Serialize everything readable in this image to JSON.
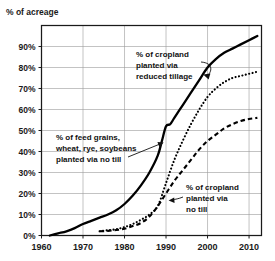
{
  "chart_data": {
    "type": "line",
    "title": "% of acreage",
    "xlabel": "",
    "ylabel": "% of acreage",
    "xlim": [
      1960,
      2013
    ],
    "ylim": [
      0,
      100
    ],
    "grid": true,
    "legend_position": "inline-annotations",
    "x_ticks": [
      "1960",
      "1970",
      "1980",
      "1990",
      "2000",
      "2010"
    ],
    "x_tick_values": [
      1960,
      1970,
      1980,
      1990,
      2000,
      2010
    ],
    "y_ticks": [
      "0%",
      "10%",
      "20%",
      "30%",
      "40%",
      "50%",
      "60%",
      "70%",
      "80%",
      "90%"
    ],
    "y_tick_values": [
      0,
      10,
      20,
      30,
      40,
      50,
      60,
      70,
      80,
      90
    ],
    "series": [
      {
        "name": "% of cropland planted via reduced tillage",
        "style": "solid",
        "x": [
          1962,
          1964,
          1966,
          1968,
          1970,
          1972,
          1974,
          1976,
          1978,
          1980,
          1982,
          1984,
          1986,
          1988,
          1989,
          1990,
          1991,
          1992,
          1994,
          1996,
          1998,
          2000,
          2002,
          2004,
          2006,
          2008,
          2010,
          2012
        ],
        "values": [
          0,
          1,
          2,
          3.5,
          5.5,
          7,
          8.5,
          10,
          12,
          15,
          19,
          24,
          30,
          38,
          45,
          52,
          53,
          56,
          62,
          68,
          74,
          80,
          84,
          87,
          89,
          91,
          93,
          95
        ]
      },
      {
        "name": "% of feed grains, wheat, rye, soybeans planted via no till",
        "style": "dotted",
        "x": [
          1974,
          1976,
          1978,
          1980,
          1982,
          1984,
          1986,
          1988,
          1990,
          1992,
          1994,
          1996,
          1998,
          2000,
          2002,
          2004,
          2006,
          2008,
          2010,
          2012
        ],
        "values": [
          2,
          2.5,
          3,
          4,
          5.5,
          7.5,
          10,
          14,
          25,
          36,
          45,
          53,
          60,
          66,
          70,
          73,
          75,
          76,
          77,
          78
        ]
      },
      {
        "name": "% of cropland planted via no till",
        "style": "dashed",
        "x": [
          1974,
          1976,
          1978,
          1980,
          1982,
          1984,
          1986,
          1988,
          1990,
          1992,
          1994,
          1996,
          1998,
          2000,
          2002,
          2004,
          2006,
          2008,
          2010,
          2012
        ],
        "values": [
          2,
          2.2,
          2.6,
          3.2,
          4.5,
          6,
          9,
          14,
          20,
          26,
          31,
          36,
          41,
          45,
          48,
          51,
          53,
          54.5,
          55.5,
          56
        ]
      }
    ],
    "annotations": [
      {
        "id": "reduced-tillage",
        "lines": [
          "% of cropland",
          "planted via",
          "reduced tillage"
        ],
        "target_series": "% of cropland planted via reduced tillage"
      },
      {
        "id": "feed-grains-no-till",
        "lines": [
          "% of feed grains,",
          "wheat, rye, soybeans",
          "planted via no till"
        ],
        "target_series": "% of feed grains, wheat, rye, soybeans planted via no till"
      },
      {
        "id": "cropland-no-till",
        "lines": [
          "% of cropland",
          "planted via",
          "no till"
        ],
        "target_series": "% of cropland planted via no till"
      }
    ]
  },
  "colors": {
    "ink": "#111111",
    "grid": "#9a9a9a",
    "background": "#ffffff"
  }
}
